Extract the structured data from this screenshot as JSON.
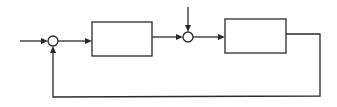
{
  "diagram": {
    "type": "feedback-control-block-diagram",
    "colors": {
      "stroke": "#2a2a2a",
      "background": "#ffffff"
    },
    "nodes": [
      {
        "id": "sum1",
        "kind": "summing-junction",
        "label": ""
      },
      {
        "id": "block1",
        "kind": "block",
        "label": ""
      },
      {
        "id": "sum2",
        "kind": "summing-junction",
        "label": ""
      },
      {
        "id": "block2",
        "kind": "block",
        "label": ""
      }
    ],
    "edges": [
      {
        "from": "input",
        "to": "sum1",
        "label": ""
      },
      {
        "from": "sum1",
        "to": "block1",
        "label": ""
      },
      {
        "from": "block1",
        "to": "sum2",
        "label": ""
      },
      {
        "from": "disturbance",
        "to": "sum2",
        "label": ""
      },
      {
        "from": "sum2",
        "to": "block2",
        "label": ""
      },
      {
        "from": "block2",
        "to": "sum1",
        "label": "",
        "kind": "feedback"
      }
    ]
  }
}
